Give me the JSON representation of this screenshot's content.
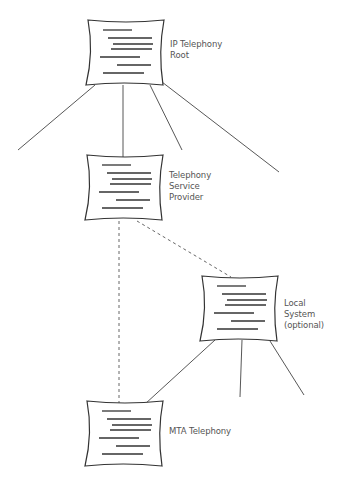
{
  "diagram": {
    "colors": {
      "stroke": "#333333",
      "text": "#555555",
      "background": "#ffffff"
    },
    "nodes": [
      {
        "id": "root",
        "icon": "document-icon",
        "lines": [
          "IP Telephony",
          "Root"
        ]
      },
      {
        "id": "tsp",
        "icon": "document-icon",
        "lines": [
          "Telephony",
          "Service",
          "Provider"
        ]
      },
      {
        "id": "local",
        "icon": "document-icon",
        "lines": [
          "Local",
          "System",
          "(optional)"
        ]
      },
      {
        "id": "mta",
        "icon": "document-icon",
        "lines": [
          "MTA Telephony"
        ]
      }
    ],
    "edges": [
      {
        "from": "root",
        "to": "tsp",
        "style": "solid"
      },
      {
        "from": "tsp",
        "to": "mta",
        "style": "dashed"
      },
      {
        "from": "tsp",
        "to": "local",
        "style": "dashed"
      },
      {
        "from": "local",
        "to": "mta",
        "style": "solid"
      }
    ]
  }
}
